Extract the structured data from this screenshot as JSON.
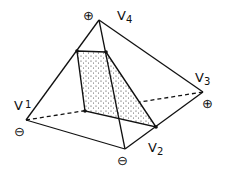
{
  "diagram": {
    "type": "tetrahedron-cross-section",
    "vertices": [
      {
        "id": "v1",
        "label": "V",
        "sub": "1",
        "sign": "⊖",
        "x": 26,
        "y": 120
      },
      {
        "id": "v2",
        "label": "V",
        "sub": "2",
        "sign": "⊖",
        "x": 125,
        "y": 149
      },
      {
        "id": "v3",
        "label": "V",
        "sub": "3",
        "sign": "⊕",
        "x": 203,
        "y": 92
      },
      {
        "id": "v4",
        "label": "V",
        "sub": "4",
        "sign": "⊕",
        "x": 99,
        "y": 20
      }
    ],
    "edges_solid": [
      [
        "v1",
        "v4"
      ],
      [
        "v4",
        "v3"
      ],
      [
        "v4",
        "v2"
      ],
      [
        "v1",
        "v2"
      ],
      [
        "v2",
        "v3"
      ]
    ],
    "edges_dashed": [
      [
        "v1",
        "v3"
      ]
    ],
    "cross_section": {
      "fill": "stippled",
      "points": [
        [
          77,
          51
        ],
        [
          106,
          52
        ],
        [
          156,
          127
        ],
        [
          85,
          111
        ]
      ]
    },
    "colors": {
      "stroke": "#111111",
      "stipple": "#333333",
      "background": "#ffffff"
    }
  }
}
